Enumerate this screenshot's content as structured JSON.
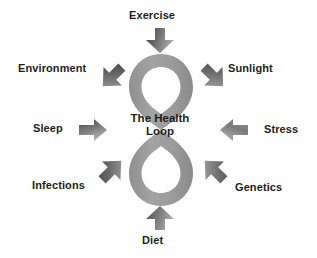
{
  "diagram": {
    "type": "hub-and-spoke",
    "title": "The Health Loop",
    "center": {
      "line1": "The Health",
      "line2": "Loop",
      "shape": "infinity-loop-figure-eight",
      "color": "#9a9a9a"
    },
    "colors": {
      "background": "#fefefe",
      "loop": "#9a9a9a",
      "arrow_dark": "#4a4a4a",
      "arrow_light": "#9d9d9d",
      "text": "#231f20"
    },
    "factors": [
      {
        "id": "exercise",
        "label": "Exercise",
        "position": "top",
        "arrow": "arrow-down-icon",
        "direction": "down"
      },
      {
        "id": "environment",
        "label": "Environment",
        "position": "top-left",
        "arrow": "arrow-down-right-icon",
        "direction": "down-right"
      },
      {
        "id": "sunlight",
        "label": "Sunlight",
        "position": "top-right",
        "arrow": "arrow-down-left-icon",
        "direction": "down-left"
      },
      {
        "id": "sleep",
        "label": "Sleep",
        "position": "left",
        "arrow": "arrow-right-icon",
        "direction": "right"
      },
      {
        "id": "stress",
        "label": "Stress",
        "position": "right",
        "arrow": "arrow-left-icon",
        "direction": "left"
      },
      {
        "id": "infections",
        "label": "Infections",
        "position": "bottom-left",
        "arrow": "arrow-up-right-icon",
        "direction": "up-right"
      },
      {
        "id": "genetics",
        "label": "Genetics",
        "position": "bottom-right",
        "arrow": "arrow-up-left-icon",
        "direction": "up-left"
      },
      {
        "id": "diet",
        "label": "Diet",
        "position": "bottom",
        "arrow": "arrow-up-icon",
        "direction": "up"
      }
    ]
  }
}
